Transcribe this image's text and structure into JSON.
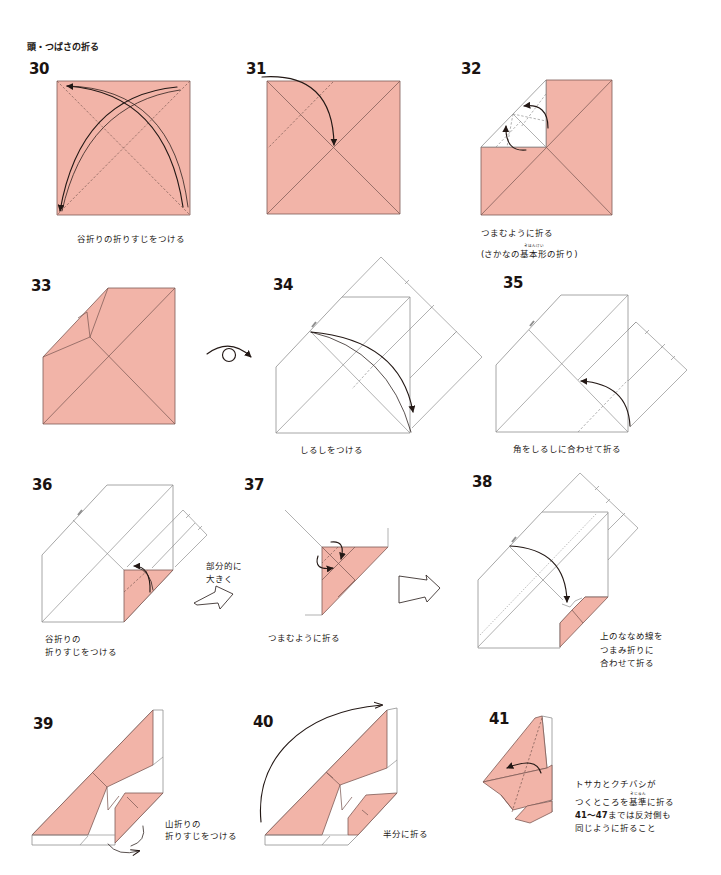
{
  "page": {
    "section_title": "頭・つばさの折る"
  },
  "colors": {
    "paper": "#f2b4a8",
    "paper_line": "#7d5b55",
    "outline": "#8f8f8f",
    "ink": "#231815"
  },
  "icons": {
    "fold_arrow": "valley-fold-arrow-icon",
    "turn_over": "turn-over-icon",
    "enlarge_arrow": "hollow-arrow-icon",
    "mountain_fold_arrow": "mountain-fold-unfold-arrow-icon"
  },
  "steps": [
    {
      "number": "30",
      "caption": [
        "谷折りの折りすじをつける"
      ]
    },
    {
      "number": "31",
      "caption": []
    },
    {
      "number": "32",
      "caption": [
        "つまむように折る"
      ],
      "caption_ruby": {
        "before": "(さかなの",
        "base": "基本形",
        "reading": "きほんけい",
        "after": "の折り)"
      }
    },
    {
      "number": "33",
      "caption": [],
      "symbol": "turn-over"
    },
    {
      "number": "34",
      "caption": [
        "しるしをつける"
      ]
    },
    {
      "number": "35",
      "caption": [
        "角をしるしに合わせて折る"
      ]
    },
    {
      "number": "36",
      "caption": [
        "谷折りの",
        "折りすじをつける"
      ],
      "side_note": [
        "部分的に",
        "大きく"
      ]
    },
    {
      "number": "37",
      "caption": [
        "つまむように折る"
      ]
    },
    {
      "number": "38",
      "caption": [
        "上のななめ線を",
        "つまみ折りに",
        "合わせて折る"
      ]
    },
    {
      "number": "39",
      "caption": [
        "山折りの",
        "折りすじをつける"
      ]
    },
    {
      "number": "40",
      "caption": [
        "半分に折る"
      ]
    },
    {
      "number": "41",
      "caption": [
        "トサカとクチバシが",
        "同じように折ること"
      ],
      "caption_ruby": {
        "before": "つくところを",
        "base": "基準",
        "reading": "きじゅん",
        "after": "に折る"
      },
      "range_line": {
        "range": "41〜47",
        "text": "までは反対側も"
      }
    }
  ]
}
